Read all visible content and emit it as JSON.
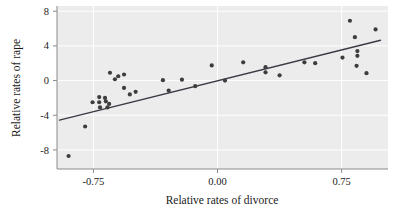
{
  "chart_data": {
    "type": "scatter",
    "title": "",
    "xlabel": "Relative rates of divorce",
    "ylabel": "Relative rates of rape",
    "xlim": [
      -0.97,
      1.03
    ],
    "ylim": [
      -10.2,
      8.6
    ],
    "xticks": [
      -0.75,
      0.0,
      0.75
    ],
    "xticklabels": [
      "-0.75",
      "0.00",
      "0.75"
    ],
    "yticks": [
      8,
      4,
      0,
      -4,
      -8
    ],
    "yticklabels": [
      "8",
      "4",
      "0",
      "-4",
      "-8"
    ],
    "grid": true,
    "grid_color": "#ffffff",
    "panel_background": "#ececec",
    "point_color": "#3d3d3d",
    "line_color": "#3a3a45",
    "axis_color": "#8a8a8a",
    "legend": null,
    "points": [
      {
        "x": -0.9,
        "y": -8.7
      },
      {
        "x": -0.8,
        "y": -5.3
      },
      {
        "x": -0.755,
        "y": -2.5
      },
      {
        "x": -0.715,
        "y": -1.9
      },
      {
        "x": -0.715,
        "y": -2.5
      },
      {
        "x": -0.71,
        "y": -3.1
      },
      {
        "x": -0.68,
        "y": -2.0
      },
      {
        "x": -0.675,
        "y": -2.4
      },
      {
        "x": -0.665,
        "y": -3.1
      },
      {
        "x": -0.655,
        "y": -2.7
      },
      {
        "x": -0.65,
        "y": 0.9
      },
      {
        "x": -0.62,
        "y": 0.15
      },
      {
        "x": -0.6,
        "y": 0.5
      },
      {
        "x": -0.565,
        "y": 0.7
      },
      {
        "x": -0.565,
        "y": -0.85
      },
      {
        "x": -0.53,
        "y": -1.6
      },
      {
        "x": -0.495,
        "y": -1.3
      },
      {
        "x": -0.33,
        "y": 0.05
      },
      {
        "x": -0.295,
        "y": -1.15
      },
      {
        "x": -0.215,
        "y": 0.1
      },
      {
        "x": -0.135,
        "y": -0.65
      },
      {
        "x": -0.035,
        "y": 1.75
      },
      {
        "x": 0.045,
        "y": 0.0
      },
      {
        "x": 0.155,
        "y": 2.1
      },
      {
        "x": 0.29,
        "y": 1.55
      },
      {
        "x": 0.29,
        "y": 0.95
      },
      {
        "x": 0.375,
        "y": 0.6
      },
      {
        "x": 0.525,
        "y": 2.1
      },
      {
        "x": 0.59,
        "y": 2.0
      },
      {
        "x": 0.755,
        "y": 2.65
      },
      {
        "x": 0.8,
        "y": 6.9
      },
      {
        "x": 0.83,
        "y": 5.0
      },
      {
        "x": 0.845,
        "y": 3.4
      },
      {
        "x": 0.845,
        "y": 2.85
      },
      {
        "x": 0.84,
        "y": 1.7
      },
      {
        "x": 0.9,
        "y": 0.85
      },
      {
        "x": 0.955,
        "y": 5.9
      }
    ],
    "fit_line": {
      "type": "linear-fit",
      "x_start": -0.955,
      "y_start": -4.55,
      "x_end": 0.985,
      "y_end": 4.65
    }
  }
}
